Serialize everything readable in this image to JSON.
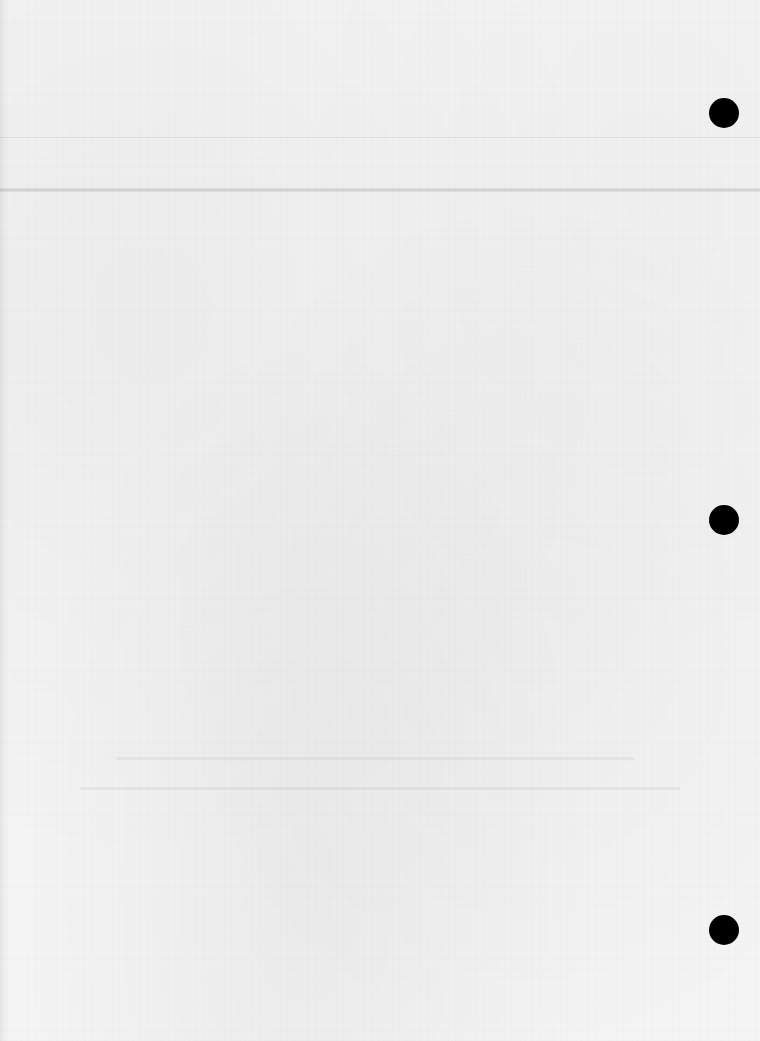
{
  "document": {
    "type": "scanned-blank-page",
    "paper_color": "#f4f4f4",
    "legible_text": []
  },
  "rules": [
    {
      "id": "rule-top-thin",
      "y": 137,
      "style": "thin",
      "color": "#e6e6e6"
    },
    {
      "id": "rule-header-band",
      "y": 188,
      "style": "thick",
      "color": "#d2d2d2"
    }
  ],
  "punch_holes": [
    {
      "id": "punch-hole-top",
      "cx": 724,
      "cy": 113,
      "r": 15,
      "color": "#000000"
    },
    {
      "id": "punch-hole-middle",
      "cx": 724,
      "cy": 520,
      "r": 15,
      "color": "#000000"
    },
    {
      "id": "punch-hole-bottom",
      "cx": 724,
      "cy": 930,
      "r": 15,
      "color": "#000000"
    }
  ],
  "bleed_through": [
    {
      "x": 115,
      "y": 757,
      "w": 520,
      "note": "illegible reverse-side ghost line"
    },
    {
      "x": 80,
      "y": 787,
      "w": 600,
      "note": "illegible reverse-side ghost line"
    }
  ]
}
